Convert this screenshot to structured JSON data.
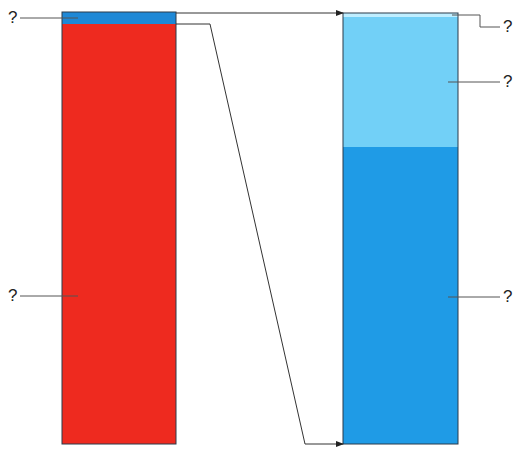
{
  "diagram": {
    "type": "stacked-bar comparison",
    "left_bar": {
      "segments": [
        {
          "name": "top-thin-segment",
          "color": "#1e88d6",
          "label": "?"
        },
        {
          "name": "main-segment",
          "color": "#ee2a1f",
          "label": "?"
        }
      ]
    },
    "right_bar": {
      "segments": [
        {
          "name": "top-sliver-segment",
          "color": "#bfeeff",
          "label": "?"
        },
        {
          "name": "upper-segment",
          "color": "#72d0f7",
          "label": "?"
        },
        {
          "name": "lower-segment",
          "color": "#1f9be6",
          "label": "?"
        }
      ]
    },
    "labels": {
      "left_top": "?",
      "left_bottom": "?",
      "right_top": "?",
      "right_middle": "?",
      "right_bottom": "?"
    },
    "colors": {
      "border": "#2b3a4a",
      "leader": "#555555"
    }
  }
}
